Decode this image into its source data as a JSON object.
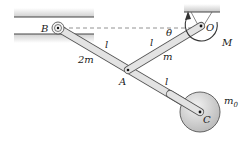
{
  "diagram": {
    "labels": {
      "B": "B",
      "O": "O",
      "M": "M",
      "theta": "θ",
      "l_upper_left": "l",
      "l_upper_right": "l",
      "l_lower": "l",
      "mass_2m": "2m",
      "mass_m": "m",
      "A": "A",
      "C": "C",
      "m0_base": "m",
      "m0_sub": "0"
    },
    "colors": {
      "bar_fill": "#e3e3e3",
      "bar_stroke": "#555555",
      "wall_shade": "#d6d6d6",
      "disk_fill": "#cfcfcf",
      "disk_stroke": "#555555"
    }
  }
}
